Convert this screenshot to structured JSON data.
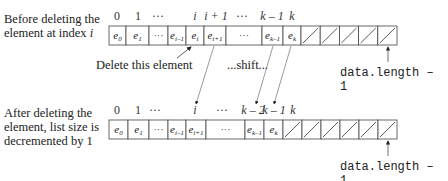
{
  "labels": {
    "before": [
      "Before deleting the",
      "element at index i"
    ],
    "after": [
      "After deleting the",
      "element, list size is",
      "decremented by 1"
    ],
    "delete_this": "Delete this element",
    "shift": "...shift...",
    "data_length_top": "data.length – 1",
    "data_length_bottom": "data.length – 1"
  },
  "top_array": {
    "indices": [
      {
        "text": "0",
        "x": 117
      },
      {
        "text": "1",
        "x": 138
      },
      {
        "text": "···",
        "x": 158
      },
      {
        "text": "i",
        "x": 195,
        "italic": true
      },
      {
        "text": "i + 1",
        "x": 216,
        "italic": true
      },
      {
        "text": "···",
        "x": 242
      },
      {
        "text": "k – 1",
        "x": 272,
        "italic": true
      },
      {
        "text": "k",
        "x": 292,
        "italic": true
      }
    ],
    "cells": [
      {
        "x": 109,
        "w": 17,
        "text": "e0"
      },
      {
        "x": 126,
        "w": 23,
        "text": "e1"
      },
      {
        "x": 149,
        "w": 19,
        "text": "..."
      },
      {
        "x": 168,
        "w": 18,
        "text": "ei-1"
      },
      {
        "x": 186,
        "w": 18,
        "text": "ei"
      },
      {
        "x": 204,
        "w": 22,
        "text": "ei+1"
      },
      {
        "x": 226,
        "w": 36,
        "text": "..."
      },
      {
        "x": 262,
        "w": 21,
        "text": "ek-1"
      },
      {
        "x": 283,
        "w": 18,
        "text": "ek"
      }
    ],
    "empty_cells": 5
  },
  "bottom_array": {
    "indices": [
      {
        "text": "0",
        "x": 117
      },
      {
        "text": "1",
        "x": 138
      },
      {
        "text": "···",
        "x": 155
      },
      {
        "text": "i",
        "x": 195,
        "italic": true
      },
      {
        "text": "···",
        "x": 222
      },
      {
        "text": "k – 2",
        "x": 253,
        "italic": true
      },
      {
        "text": "k – 1",
        "x": 274,
        "italic": true
      },
      {
        "text": "k",
        "x": 293,
        "italic": true
      }
    ],
    "cells": [
      {
        "x": 109,
        "w": 19,
        "text": "e0"
      },
      {
        "x": 128,
        "w": 21,
        "text": "e1"
      },
      {
        "x": 149,
        "w": 19,
        "text": "..."
      },
      {
        "x": 168,
        "w": 18,
        "text": "ei-1"
      },
      {
        "x": 186,
        "w": 20,
        "text": "ei+1"
      },
      {
        "x": 206,
        "w": 39,
        "text": "..."
      },
      {
        "x": 245,
        "w": 19,
        "text": "ek-1"
      },
      {
        "x": 264,
        "w": 19,
        "text": "ek"
      }
    ],
    "empty_cells": 6
  }
}
